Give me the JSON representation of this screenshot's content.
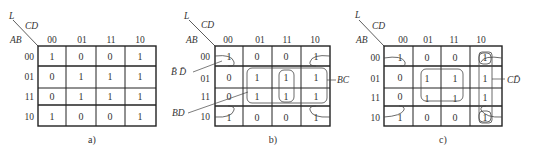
{
  "maps": [
    {
      "id": "a",
      "caption": "a)",
      "corner": {
        "output": "L",
        "col_vars": "CD",
        "row_vars": "AB"
      },
      "col_headers": [
        "00",
        "01",
        "11",
        "10"
      ],
      "row_headers": [
        "00",
        "01",
        "11",
        "10"
      ],
      "cells": [
        [
          "1",
          "0",
          "0",
          "1"
        ],
        [
          "0",
          "1",
          "1",
          "1"
        ],
        [
          "0",
          "1",
          "1",
          "1"
        ],
        [
          "1",
          "0",
          "0",
          "1"
        ]
      ],
      "groups": []
    },
    {
      "id": "b",
      "caption": "b)",
      "corner": {
        "output": "L",
        "col_vars": "CD",
        "row_vars": "AB"
      },
      "col_headers": [
        "00",
        "01",
        "11",
        "10"
      ],
      "row_headers": [
        "00",
        "01",
        "11",
        "10"
      ],
      "cells": [
        [
          "1",
          "0",
          "0",
          "1"
        ],
        [
          "0",
          "1",
          "1",
          "1"
        ],
        [
          "0",
          "1",
          "1",
          "1"
        ],
        [
          "1",
          "0",
          "0",
          "1"
        ]
      ],
      "groups": [
        {
          "label": "B̄ D̄",
          "cells": "four corners"
        },
        {
          "label": "BC",
          "cells": "rows 01,11 × cols 11,10"
        },
        {
          "label": "BD",
          "cells": "rows 01,11 × cols 01,11"
        }
      ]
    },
    {
      "id": "c",
      "caption": "c)",
      "corner": {
        "output": "L",
        "col_vars": "CD",
        "row_vars": "AB"
      },
      "col_headers": [
        "00",
        "01",
        "11",
        "10"
      ],
      "row_headers": [
        "00",
        "01",
        "11",
        "10"
      ],
      "cells": [
        [
          "1",
          "0",
          "0",
          "1"
        ],
        [
          "0",
          "1",
          "1",
          "1"
        ],
        [
          "0",
          "1",
          "1",
          "1"
        ],
        [
          "1",
          "0",
          "0",
          "1"
        ]
      ],
      "groups": [
        {
          "label": "C D̄",
          "cells": "column 10"
        },
        {
          "label": "",
          "cells": "four corners"
        },
        {
          "label": "",
          "cells": "rows 01,11 × cols 01,11"
        }
      ]
    }
  ],
  "labels": {
    "b_bd_bar": "B̄ D̄",
    "b_bc": "BC",
    "b_bd": "BD",
    "c_cd_bar": "CD̄"
  }
}
